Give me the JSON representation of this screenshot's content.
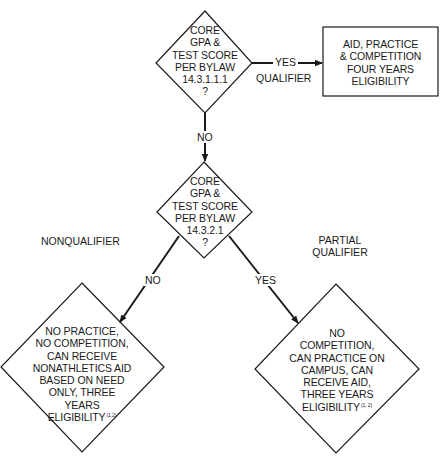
{
  "diagram": {
    "type": "flowchart",
    "colors": {
      "stroke": "#1a1a1a",
      "background": "#ffffff",
      "text": "#1a1a1a"
    },
    "nodes": {
      "decision_1": {
        "shape": "diamond",
        "lines": [
          "CORE",
          "GPA &",
          "TEST SCORE",
          "PER BYLAW",
          "14.3.1.1.1",
          "?"
        ]
      },
      "outcome_qualifier": {
        "shape": "rectangle",
        "lines": [
          "AID, PRACTICE",
          "& COMPETITION",
          "FOUR YEARS",
          "ELIGIBILITY"
        ]
      },
      "decision_2": {
        "shape": "diamond",
        "lines": [
          "CORE",
          "GPA &",
          "TEST SCORE",
          "PER BYLAW",
          "14.3.2.1",
          "?"
        ]
      },
      "outcome_nonqualifier": {
        "shape": "diamond",
        "lines": [
          "NO PRACTICE,",
          "NO COMPETITION,",
          "CAN RECEIVE",
          "NONATHLETICS AID",
          "BASED ON NEED",
          "ONLY, THREE",
          "YEARS",
          "ELIGIBILITY"
        ],
        "footnote": "(1,2)"
      },
      "outcome_partial_qualifier": {
        "shape": "diamond",
        "lines": [
          "NO",
          "COMPETITION,",
          "CAN PRACTICE ON",
          "CAMPUS, CAN",
          "RECEIVE AID,",
          "THREE YEARS",
          "ELIGIBILITY"
        ],
        "footnote": "(1, 2)"
      }
    },
    "edges": {
      "d1_yes": {
        "label": "YES",
        "from": "decision_1",
        "to": "outcome_qualifier"
      },
      "d1_no": {
        "label": "NO",
        "from": "decision_1",
        "to": "decision_2"
      },
      "d2_no": {
        "label": "NO",
        "from": "decision_2",
        "to": "outcome_nonqualifier"
      },
      "d2_yes": {
        "label": "YES",
        "from": "decision_2",
        "to": "outcome_partial_qualifier"
      }
    },
    "category_labels": {
      "qualifier": "QUALIFIER",
      "nonqualifier": "NONQUALIFIER",
      "partial_qualifier_line1": "PARTIAL",
      "partial_qualifier_line2": "QUALIFIER"
    }
  }
}
